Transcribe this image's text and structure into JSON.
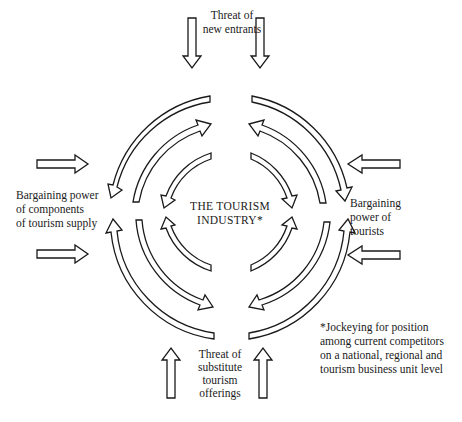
{
  "diagram": {
    "center_label": [
      "THE TOURISM",
      "INDUSTRY*"
    ],
    "forces": {
      "top": {
        "label": [
          "Threat of",
          "new entrants"
        ],
        "arrow_direction": "down"
      },
      "bottom": {
        "label": [
          "Threat of",
          "substitute",
          "tourism",
          "offerings"
        ],
        "arrow_direction": "up"
      },
      "left": {
        "label": [
          "Bargaining power",
          "of components",
          "of tourism supply"
        ],
        "arrow_direction": "right"
      },
      "right": {
        "label": [
          "Bargaining",
          "power of",
          "tourists"
        ],
        "arrow_direction": "left"
      }
    },
    "footnote": [
      "*Jockeying for position",
      "among current competitors",
      "on a national, regional and",
      "tourism business unit level"
    ],
    "colors": {
      "stroke": "#1a1a1a",
      "fill": "#ffffff",
      "background": "#ffffff"
    }
  }
}
